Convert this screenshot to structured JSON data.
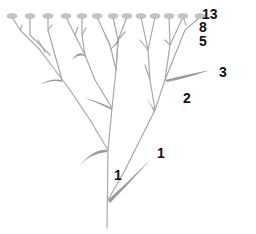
{
  "figure": {
    "stem_color": "#a8a8a8",
    "leaf_color": "#9c9c9c",
    "flower_color": "#bdbdbd",
    "label_color": "#111111"
  },
  "labels": [
    {
      "id": "count-13",
      "text": "13",
      "x": 202,
      "y": 7
    },
    {
      "id": "count-8",
      "text": "8",
      "x": 199,
      "y": 20
    },
    {
      "id": "count-5",
      "text": "5",
      "x": 199,
      "y": 34
    },
    {
      "id": "count-3",
      "text": "3",
      "x": 219,
      "y": 65
    },
    {
      "id": "count-2",
      "text": "2",
      "x": 183,
      "y": 91
    },
    {
      "id": "count-1-right",
      "text": "1",
      "x": 157,
      "y": 146
    },
    {
      "id": "count-1-left",
      "text": "1",
      "x": 114,
      "y": 168
    }
  ]
}
